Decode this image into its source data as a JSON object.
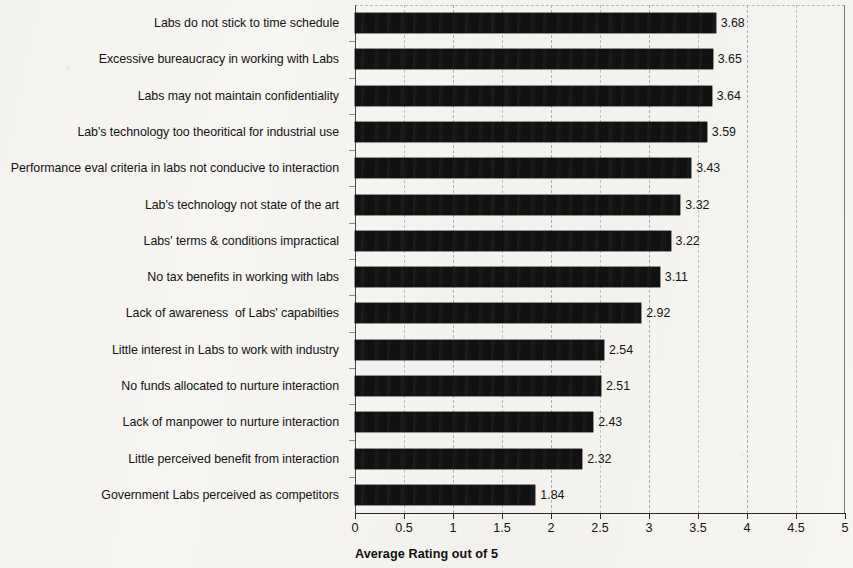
{
  "chart_data": {
    "type": "bar",
    "orientation": "horizontal",
    "title": "",
    "xlabel": "Average Rating out of 5",
    "ylabel": "",
    "xlim": [
      0,
      5
    ],
    "xticks": [
      "0",
      "0.5",
      "1",
      "1.5",
      "2",
      "2.5",
      "3",
      "3.5",
      "4",
      "4.5",
      "5"
    ],
    "xtick_step": 0.5,
    "grid": "vertical-dashed",
    "legend": "none",
    "bar_color": "#111111",
    "background_color": "#f6f5f2",
    "categories": [
      "Labs do not stick to time schedule",
      "Excessive bureaucracy in working with Labs",
      "Labs may not maintain confidentiality",
      "Lab's technology too theoritical for industrial use",
      "Performance eval criteria in labs not conducive to interaction",
      "Lab's technology not state of the art",
      "Labs' terms & conditions impractical",
      "No tax benefits in working with labs",
      "Lack of awareness  of Labs' capabilties",
      "Little interest in Labs to work with industry",
      "No funds allocated to nurture interaction",
      "Lack of manpower to nurture interaction",
      "Little perceived benefit from interaction",
      "Government Labs perceived as competitors"
    ],
    "values": [
      3.68,
      3.65,
      3.64,
      3.59,
      3.43,
      3.32,
      3.22,
      3.11,
      2.92,
      2.54,
      2.51,
      2.43,
      2.32,
      1.84
    ],
    "value_labels": [
      "3.68",
      "3.65",
      "3.64",
      "3.59",
      "3.43",
      "3.32",
      "3.22",
      "3.11",
      "2.92",
      "2.54",
      "2.51",
      "2.43",
      "2.32",
      "1.84"
    ]
  }
}
